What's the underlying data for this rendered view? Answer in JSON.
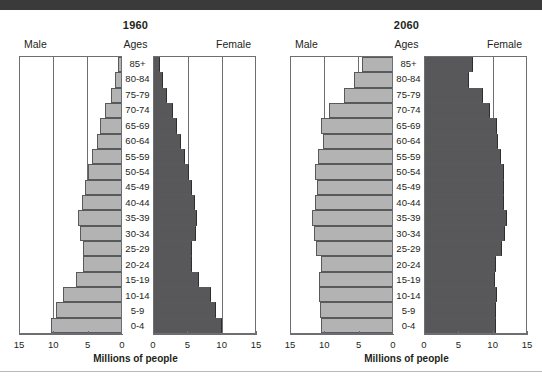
{
  "figure": {
    "axis_title": "Millions of people",
    "label_male": "Male",
    "label_female": "Female",
    "label_ages": "Ages",
    "colors": {
      "male_bar": "#b3b3b3",
      "female_bar": "#58585a",
      "axis": "#6d6e71",
      "text": "#231f20",
      "top_band": "#3a3a3a"
    }
  },
  "panels": [
    {
      "year": "1960"
    },
    {
      "year": "2060"
    }
  ],
  "chart_data": [
    {
      "type": "bar",
      "title": "1960",
      "subtitle": "Population pyramid",
      "orientation": "horizontal-diverging",
      "xlabel": "Millions of people",
      "ylabel": "Ages",
      "xlim": [
        0,
        15
      ],
      "tick_labels_left": [
        "15",
        "10",
        "5",
        "0"
      ],
      "tick_labels_right": [
        "0",
        "5",
        "10",
        "15"
      ],
      "ticks": [
        15,
        10,
        5,
        0
      ],
      "grid": true,
      "legend": [
        "Male",
        "Female"
      ],
      "legend_position": "top-outside",
      "categories": [
        "85+",
        "80-84",
        "75-79",
        "70-74",
        "65-69",
        "60-64",
        "55-59",
        "50-54",
        "45-49",
        "40-44",
        "35-39",
        "30-34",
        "25-29",
        "20-24",
        "15-19",
        "10-14",
        "5-9",
        "0-4"
      ],
      "series": [
        {
          "name": "Male",
          "direction": "left",
          "values": [
            0.5,
            0.9,
            1.5,
            2.3,
            3.0,
            3.5,
            4.2,
            4.8,
            5.3,
            5.7,
            6.2,
            6.0,
            5.5,
            5.5,
            6.6,
            8.5,
            9.4,
            10.2
          ]
        },
        {
          "name": "Female",
          "direction": "right",
          "values": [
            0.9,
            1.3,
            1.9,
            2.7,
            3.4,
            3.9,
            4.5,
            5.1,
            5.5,
            5.9,
            6.3,
            6.1,
            5.6,
            5.6,
            6.6,
            8.3,
            9.1,
            9.9
          ]
        }
      ]
    },
    {
      "type": "bar",
      "title": "2060",
      "subtitle": "Population pyramid",
      "orientation": "horizontal-diverging",
      "xlabel": "Millions of people",
      "ylabel": "Ages",
      "xlim": [
        0,
        15
      ],
      "tick_labels_left": [
        "15",
        "10",
        "5",
        "0"
      ],
      "tick_labels_right": [
        "0",
        "5",
        "10",
        "15"
      ],
      "ticks": [
        15,
        10,
        5,
        0
      ],
      "grid": true,
      "legend": [
        "Male",
        "Female"
      ],
      "legend_position": "top-outside",
      "categories": [
        "85+",
        "80-84",
        "75-79",
        "70-74",
        "65-69",
        "60-64",
        "55-59",
        "50-54",
        "45-49",
        "40-44",
        "35-39",
        "30-34",
        "25-29",
        "20-24",
        "15-19",
        "10-14",
        "5-9",
        "0-4"
      ],
      "series": [
        {
          "name": "Male",
          "direction": "left",
          "values": [
            4.3,
            5.5,
            7.0,
            9.2,
            10.3,
            10.1,
            10.8,
            11.2,
            10.9,
            11.2,
            11.6,
            11.4,
            11.0,
            10.3,
            10.6,
            10.6,
            10.5,
            10.4
          ]
        },
        {
          "name": "Female",
          "direction": "right",
          "values": [
            7.0,
            6.4,
            8.4,
            9.5,
            10.5,
            10.6,
            11.0,
            11.5,
            11.5,
            11.5,
            11.9,
            11.7,
            11.2,
            10.3,
            10.2,
            10.5,
            10.4,
            10.4
          ]
        }
      ]
    }
  ]
}
